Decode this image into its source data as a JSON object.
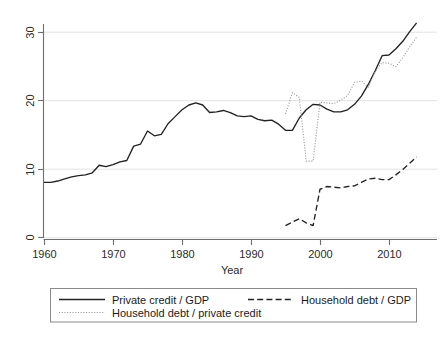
{
  "chart_data": {
    "type": "line",
    "title": "",
    "xlabel": "Year",
    "ylabel": "",
    "xlim": [
      1958,
      2015.5
    ],
    "ylim": [
      -1.2,
      32.5
    ],
    "xticks": [
      1960,
      1970,
      1980,
      1990,
      2000,
      2010
    ],
    "xticklabels": [
      "1960",
      "1970",
      "1980",
      "1990",
      "2000",
      "2010"
    ],
    "yticks": [
      0,
      10,
      20,
      30
    ],
    "yticklabels": [
      "0",
      "10",
      "20",
      "30"
    ],
    "grid": "horizontal",
    "legend_position": "below-axes",
    "series": [
      {
        "name": "Private credit / GDP",
        "style": "solid",
        "color": "#222222",
        "x": [
          1960,
          1961,
          1962,
          1963,
          1964,
          1965,
          1966,
          1967,
          1968,
          1969,
          1970,
          1971,
          1972,
          1973,
          1974,
          1975,
          1976,
          1977,
          1978,
          1979,
          1980,
          1981,
          1982,
          1983,
          1984,
          1985,
          1986,
          1987,
          1988,
          1989,
          1990,
          1991,
          1992,
          1993,
          1994,
          1995,
          1996,
          1997,
          1998,
          1999,
          2000,
          2001,
          2002,
          2003,
          2004,
          2005,
          2006,
          2007,
          2008,
          2009,
          2010,
          2011,
          2012,
          2013,
          2014
        ],
        "values": [
          8.0,
          8.0,
          8.2,
          8.5,
          8.8,
          9.0,
          9.1,
          9.4,
          10.5,
          10.3,
          10.6,
          11.0,
          11.2,
          13.3,
          13.6,
          15.5,
          14.8,
          15.0,
          16.6,
          17.6,
          18.6,
          19.3,
          19.6,
          19.3,
          18.2,
          18.3,
          18.5,
          18.2,
          17.7,
          17.6,
          17.7,
          17.2,
          17.0,
          17.1,
          16.5,
          15.6,
          15.6,
          17.4,
          18.6,
          19.4,
          19.3,
          18.7,
          18.3,
          18.3,
          18.6,
          19.4,
          20.6,
          22.3,
          24.3,
          26.5,
          26.6,
          27.5,
          28.6,
          30.0,
          31.3
        ]
      },
      {
        "name": "Household debt / GDP",
        "style": "dashed",
        "color": "#222222",
        "x": [
          1995,
          1996,
          1997,
          1998,
          1999,
          2000,
          2001,
          2002,
          2003,
          2004,
          2005,
          2006,
          2007,
          2008,
          2009,
          2010,
          2011,
          2012,
          2013,
          2014
        ],
        "values": [
          1.7,
          2.2,
          2.7,
          2.1,
          1.7,
          7.0,
          7.4,
          7.3,
          7.2,
          7.4,
          7.5,
          8.0,
          8.5,
          8.6,
          8.4,
          8.4,
          9.1,
          9.9,
          10.8,
          11.7
        ]
      },
      {
        "name": "Household debt / private credit",
        "style": "dotted",
        "color": "#9a9a9a",
        "x": [
          1995,
          1996,
          1997,
          1998,
          1999,
          2000,
          2001,
          2002,
          2003,
          2004,
          2005,
          2006,
          2007,
          2008,
          2009,
          2010,
          2011,
          2012,
          2013,
          2014
        ],
        "values": [
          18.0,
          21.1,
          20.4,
          11.1,
          11.1,
          19.7,
          19.6,
          19.5,
          20.0,
          20.7,
          22.6,
          22.8,
          21.9,
          24.2,
          25.5,
          25.4,
          24.9,
          26.2,
          27.8,
          29.2
        ]
      }
    ]
  },
  "axis": {
    "x_title": "Year",
    "x_tick_labels": [
      "1960",
      "1970",
      "1980",
      "1990",
      "2000",
      "2010"
    ],
    "y_tick_labels": [
      "0",
      "10",
      "20",
      "30"
    ]
  },
  "legend": {
    "entries": [
      {
        "label": "Private credit / GDP",
        "style": "solid"
      },
      {
        "label": "Household debt / GDP",
        "style": "dashed"
      },
      {
        "label": "Household debt / private credit",
        "style": "dotted"
      }
    ]
  }
}
